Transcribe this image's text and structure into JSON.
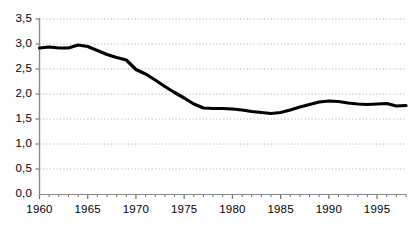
{
  "chart_data": {
    "type": "line",
    "title": "",
    "subtitle": "",
    "xlabel": "",
    "ylabel": "",
    "xlim": [
      1960,
      1998
    ],
    "ylim": [
      0.0,
      3.5
    ],
    "grid": true,
    "grid_axis": "y",
    "grid_style": "dotted",
    "legend": false,
    "legend_position": "none",
    "decimal_separator": ",",
    "line_color": "#000000",
    "line_width": 3.2,
    "y_tick_labels": [
      "0,0",
      "0,5",
      "1,0",
      "1,5",
      "2,0",
      "2,5",
      "3,0",
      "3,5"
    ],
    "y_tick_values": [
      0.0,
      0.5,
      1.0,
      1.5,
      2.0,
      2.5,
      3.0,
      3.5
    ],
    "x_tick_labels": [
      "1960",
      "1965",
      "1970",
      "1975",
      "1980",
      "1985",
      "1990",
      "1995"
    ],
    "x_tick_values": [
      1960,
      1965,
      1970,
      1975,
      1980,
      1985,
      1990,
      1995
    ],
    "x_minor_tick_step": 1,
    "x": [
      1960,
      1961,
      1962,
      1963,
      1964,
      1965,
      1966,
      1967,
      1968,
      1969,
      1970,
      1971,
      1972,
      1973,
      1974,
      1975,
      1976,
      1977,
      1978,
      1979,
      1980,
      1981,
      1982,
      1983,
      1984,
      1985,
      1986,
      1987,
      1988,
      1989,
      1990,
      1991,
      1992,
      1993,
      1994,
      1995,
      1996,
      1997,
      1998
    ],
    "values": [
      2.92,
      2.94,
      2.92,
      2.92,
      2.98,
      2.95,
      2.87,
      2.79,
      2.73,
      2.68,
      2.49,
      2.4,
      2.28,
      2.15,
      2.03,
      1.92,
      1.8,
      1.72,
      1.71,
      1.71,
      1.7,
      1.68,
      1.65,
      1.63,
      1.61,
      1.63,
      1.68,
      1.74,
      1.79,
      1.84,
      1.86,
      1.85,
      1.82,
      1.8,
      1.79,
      1.8,
      1.81,
      1.76,
      1.77
    ],
    "series": [
      {
        "name": "series-1",
        "values": [
          2.92,
          2.94,
          2.92,
          2.92,
          2.98,
          2.95,
          2.87,
          2.79,
          2.73,
          2.68,
          2.49,
          2.4,
          2.28,
          2.15,
          2.03,
          1.92,
          1.8,
          1.72,
          1.71,
          1.71,
          1.7,
          1.68,
          1.65,
          1.63,
          1.61,
          1.63,
          1.68,
          1.74,
          1.79,
          1.84,
          1.86,
          1.85,
          1.82,
          1.8,
          1.79,
          1.8,
          1.81,
          1.76,
          1.77
        ]
      }
    ],
    "annotations": []
  }
}
